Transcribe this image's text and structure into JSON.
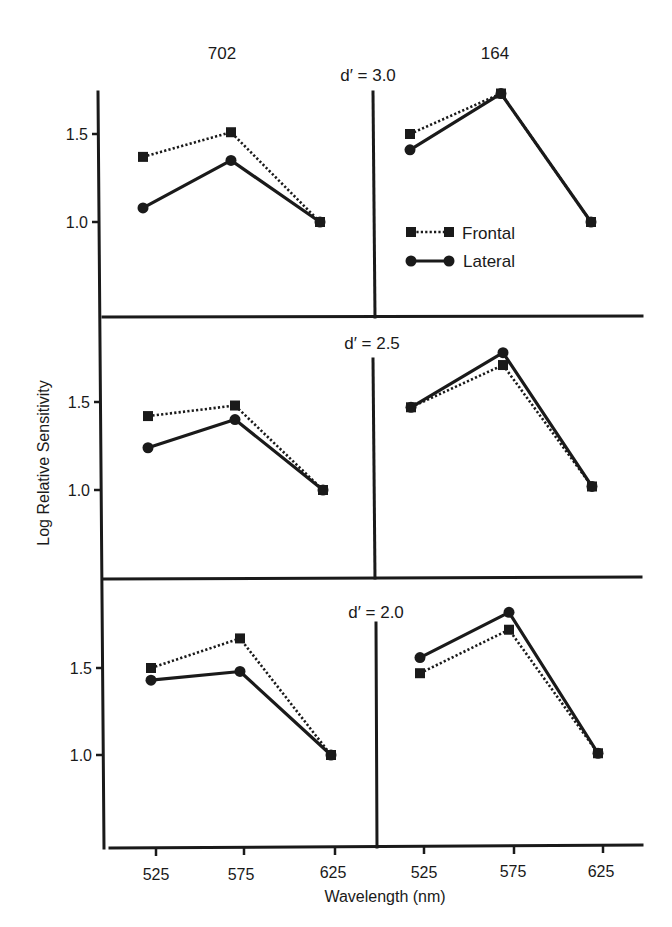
{
  "chart_data": {
    "type": "line",
    "title": "",
    "column_labels": [
      "702",
      "164"
    ],
    "xlabel": "Wavelength (nm)",
    "ylabel": "Log Relative Sensitivity",
    "categories": [
      "525",
      "575",
      "625"
    ],
    "ytick_labels": [
      "1.0",
      "1.5"
    ],
    "ylim": [
      0.5,
      1.9
    ],
    "grid": false,
    "legend": {
      "position": "top-right panel (inside 164, d' = 3.0)",
      "entries": [
        {
          "name": "Frontal",
          "style": "dotted line, square markers"
        },
        {
          "name": "Lateral",
          "style": "solid line, circle markers"
        }
      ]
    },
    "panels": [
      {
        "row_label": "d′ = 3.0",
        "subject": "702",
        "series": [
          {
            "name": "Frontal",
            "values": [
              1.37,
              1.51,
              1.0
            ]
          },
          {
            "name": "Lateral",
            "values": [
              1.08,
              1.35,
              1.0
            ]
          }
        ]
      },
      {
        "row_label": "d′ = 3.0",
        "subject": "164",
        "series": [
          {
            "name": "Frontal",
            "values": [
              1.5,
              1.73,
              1.0
            ]
          },
          {
            "name": "Lateral",
            "values": [
              1.41,
              1.73,
              1.0
            ]
          }
        ]
      },
      {
        "row_label": "d′ = 2.5",
        "subject": "702",
        "series": [
          {
            "name": "Frontal",
            "values": [
              1.42,
              1.48,
              1.0
            ]
          },
          {
            "name": "Lateral",
            "values": [
              1.24,
              1.4,
              1.0
            ]
          }
        ]
      },
      {
        "row_label": "d′ = 2.5",
        "subject": "164",
        "series": [
          {
            "name": "Frontal",
            "values": [
              1.47,
              1.71,
              1.02
            ]
          },
          {
            "name": "Lateral",
            "values": [
              1.47,
              1.78,
              1.02
            ]
          }
        ]
      },
      {
        "row_label": "d′ = 2.0",
        "subject": "702",
        "series": [
          {
            "name": "Frontal",
            "values": [
              1.5,
              1.67,
              1.0
            ]
          },
          {
            "name": "Lateral",
            "values": [
              1.43,
              1.48,
              1.0
            ]
          }
        ]
      },
      {
        "row_label": "d′ = 2.0",
        "subject": "164",
        "series": [
          {
            "name": "Frontal",
            "values": [
              1.47,
              1.72,
              1.01
            ]
          },
          {
            "name": "Lateral",
            "values": [
              1.56,
              1.82,
              1.01
            ]
          }
        ]
      }
    ]
  },
  "labels": {
    "col_left": "702",
    "col_right": "164",
    "row_top": "d′ = 3.0",
    "row_mid": "d′ = 2.5",
    "row_bot": "d′ = 2.0",
    "ylabel": "Log Relative Sensitivity",
    "xlabel": "Wavelength (nm)",
    "legend_frontal": "Frontal",
    "legend_lateral": "Lateral",
    "ytick_1_5": "1.5",
    "ytick_1_0": "1.0",
    "xtick_525": "525",
    "xtick_575": "575",
    "xtick_625": "625"
  }
}
